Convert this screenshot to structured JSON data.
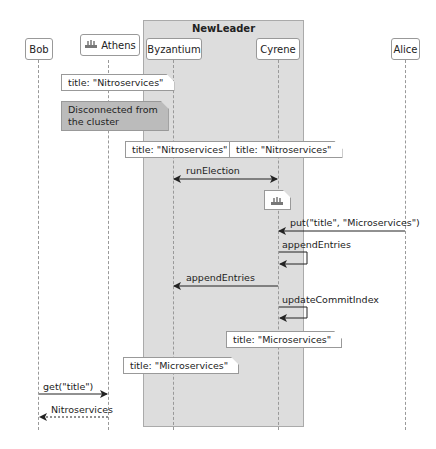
{
  "diagram": {
    "type": "sequence",
    "group": {
      "title": "NewLeader",
      "color": "#dddddd"
    },
    "participants": [
      {
        "id": "bob",
        "label": "Bob",
        "icon": null
      },
      {
        "id": "athens",
        "label": "Athens",
        "icon": "ship-icon"
      },
      {
        "id": "byzantium",
        "label": "Byzantium",
        "icon": null
      },
      {
        "id": "cyrene",
        "label": "Cyrene",
        "icon": null
      },
      {
        "id": "alice",
        "label": "Alice",
        "icon": null
      }
    ],
    "notes": [
      {
        "over": "Athens",
        "text": "title: \"Nitroservices\""
      },
      {
        "over": "Athens",
        "text_line1": "Disconnected from",
        "text_line2": "the cluster",
        "color": "#bbbbbb"
      },
      {
        "over": "Byzantium",
        "text": "title: \"Nitroservices\""
      },
      {
        "over": "Cyrene",
        "text": "title: \"Nitroservices\""
      },
      {
        "over": "Cyrene",
        "icon": "ship-icon"
      },
      {
        "over": "Cyrene",
        "text": "title: \"Microservices\""
      },
      {
        "over": "Byzantium",
        "text": "title: \"Microservices\""
      }
    ],
    "messages": [
      {
        "from": "Byzantium",
        "to": "Cyrene",
        "label": "runElection",
        "style": "bidirectional"
      },
      {
        "from": "Alice",
        "to": "Cyrene",
        "label": "put(\"title\", \"Microservices\")",
        "style": "solid"
      },
      {
        "from": "Cyrene",
        "to": "Cyrene",
        "label": "appendEntries",
        "style": "self"
      },
      {
        "from": "Cyrene",
        "to": "Byzantium",
        "label": "appendEntries",
        "style": "solid"
      },
      {
        "from": "Cyrene",
        "to": "Cyrene",
        "label": "updateCommitIndex",
        "style": "self"
      },
      {
        "from": "Bob",
        "to": "Athens",
        "label": "get(\"title\")",
        "style": "solid"
      },
      {
        "from": "Athens",
        "to": "Bob",
        "label": "Nitroservices",
        "style": "dashed"
      }
    ]
  }
}
